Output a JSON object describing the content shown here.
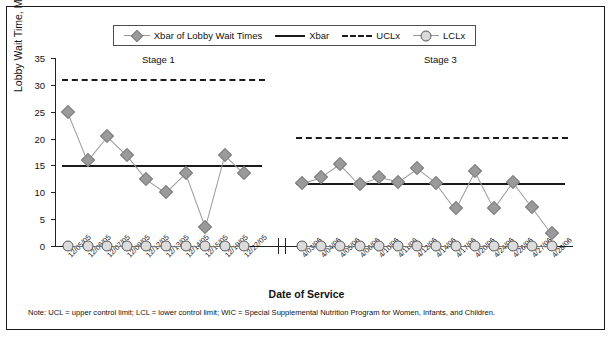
{
  "legend": {
    "items": [
      {
        "label": "Xbar of Lobby Wait Times",
        "marker": "diamond-line"
      },
      {
        "label": "Xbar",
        "marker": "solid-line"
      },
      {
        "label": "UCLx",
        "marker": "dashed-line"
      },
      {
        "label": "LCLx",
        "marker": "circle-line"
      }
    ]
  },
  "stages": [
    {
      "label": "Stage 1"
    },
    {
      "label": "Stage 3"
    }
  ],
  "note": "Note: UCL = upper control limit; LCL = lower control limit; WIC = Special Supplemental Nutrition Program for Women, Infants, and Children.",
  "chart_data": {
    "type": "line",
    "title": "",
    "xlabel": "Date of Service",
    "ylabel": "Lobby Wait Time, Min",
    "ylim": [
      0,
      35
    ],
    "yticks": [
      0,
      5,
      10,
      15,
      20,
      25,
      30,
      35
    ],
    "grid": false,
    "legend_position": "top-center",
    "axis_break": true,
    "categories": [
      "12/05/05",
      "12/06/05",
      "12/07/05",
      "12/09/05",
      "12/12/05",
      "12/13/05",
      "12/14/05",
      "12/15/05",
      "12/19/05",
      "12/22/05",
      "4/03/06",
      "4/04/06",
      "4/05/06",
      "4/06/06",
      "4/10/06",
      "4/11/06",
      "4/12/06",
      "4/14/06",
      "4/17/06",
      "4/20/06",
      "4/24/06",
      "4/26/06",
      "4/27/06",
      "4/28/06"
    ],
    "series": [
      {
        "name": "Xbar of Lobby Wait Times",
        "stage1_values": [
          25,
          16,
          20.5,
          17,
          12.5,
          10,
          13.5,
          3.5,
          17,
          13.5
        ],
        "stage3_values": [
          11.8,
          12.8,
          15.3,
          11.5,
          12.8,
          12,
          14.5,
          11.8,
          7,
          14,
          7,
          12,
          7.3,
          2.5
        ]
      },
      {
        "name": "LCLx",
        "stage1_values": [
          0,
          0,
          0,
          0,
          0,
          0,
          0,
          0,
          0,
          0
        ],
        "stage3_values": [
          0,
          0,
          0,
          0,
          0,
          0,
          0,
          0,
          0,
          0,
          0,
          0,
          0,
          0
        ]
      }
    ],
    "control_limits": {
      "stage1": {
        "xbar": 15,
        "ucl": 31,
        "lcl": 0
      },
      "stage3": {
        "xbar": 11.8,
        "ucl": 20.2,
        "lcl": 0
      }
    }
  }
}
